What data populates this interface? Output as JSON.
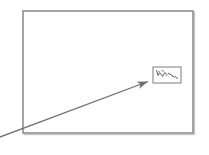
{
  "figure": {
    "title": "Scanned figure with magnified inset callout",
    "background_color": "#ffffff",
    "width": 209,
    "height": 155
  },
  "main_frame": {
    "name": "main-image-frame",
    "x": 23,
    "y": 11,
    "width": 170,
    "height": 122,
    "stroke_color": "#8f8f8f",
    "stroke_width": 1.6,
    "fill_color": "#fefefe",
    "shadow_color": "#c9c9c9"
  },
  "inset_box": {
    "name": "magnified-detail-box",
    "x": 153,
    "y": 67,
    "width": 28,
    "height": 16,
    "stroke_color": "#7d7d7d",
    "stroke_width": 1.0,
    "fill_color": "#fdfdfd",
    "marks_color": "#4a4a4a"
  },
  "leader_arrow": {
    "name": "callout-leader-arrow",
    "start_x": -8,
    "start_y": 140,
    "end_x": 152,
    "end_y": 80,
    "stroke_color": "#6e6e6e",
    "stroke_width": 1.2,
    "arrowhead_length": 11,
    "arrowhead_width": 5
  },
  "faint_texture": {
    "name": "scan-background-mottling",
    "color": "#f2f2f2",
    "opacity": 0.85
  }
}
